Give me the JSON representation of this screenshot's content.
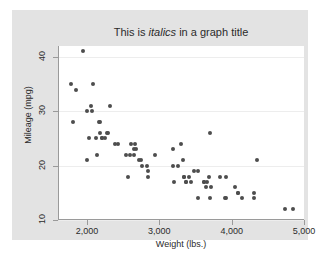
{
  "figure": {
    "background_color": "#e3e3e3",
    "plot_background_color": "#ffffff",
    "axis_color": "#9a9a9a",
    "grid_color": "#ededed",
    "marker_color": "#4d4d4d"
  },
  "title": {
    "prefix": "This is ",
    "emphasis": "italics",
    "suffix": " in a graph title"
  },
  "chart_data": {
    "type": "scatter",
    "title": "This is italics in a graph title",
    "title_emphasis_word": "italics",
    "xlabel": "Weight (lbs.)",
    "ylabel": "Mileage (mpg)",
    "xlim": [
      1600,
      5000
    ],
    "ylim": [
      10,
      42
    ],
    "xticks": [
      2000,
      3000,
      4000,
      5000
    ],
    "xticklabels": [
      "2,000",
      "3,000",
      "4,000",
      "5,000"
    ],
    "yticks": [
      10,
      20,
      30,
      40
    ],
    "yticklabels": [
      "10",
      "20",
      "30",
      "40"
    ],
    "grid": true,
    "grid_axis": "y",
    "legend": null,
    "marker": "circle",
    "marker_size": 4,
    "n_points": 74,
    "series": [
      {
        "name": "Mileage vs Weight",
        "x": [
          2930,
          3350,
          2640,
          3250,
          4080,
          3670,
          3690,
          3180,
          3700,
          3470,
          3600,
          3905,
          3330,
          4290,
          4080,
          3350,
          4030,
          3640,
          4720,
          3830,
          2580,
          3280,
          3400,
          2730,
          2370,
          2020,
          2280,
          2750,
          1800,
          1990,
          3600,
          3330,
          3185,
          3690,
          3910,
          3520,
          3425,
          3630,
          3525,
          4130,
          3320,
          4330,
          3900,
          4290,
          2110,
          2200,
          2150,
          2670,
          2595,
          2700,
          2556,
          2200,
          2120,
          2650,
          2230,
          2830,
          2810,
          1760,
          2050,
          2410,
          2520,
          2260,
          2300,
          2640,
          2830,
          2070,
          1930,
          1990,
          2160,
          2040,
          1830,
          2160,
          4840,
          3170
        ],
        "y": [
          22,
          17,
          22,
          20,
          15,
          18,
          26,
          20,
          16,
          19,
          17,
          18,
          18,
          15,
          15,
          17,
          16,
          17,
          12,
          18,
          22,
          24,
          18,
          21,
          24,
          25,
          26,
          20,
          28,
          21,
          17,
          18,
          17,
          14,
          14,
          14,
          17,
          16,
          19,
          14,
          21,
          21,
          14,
          14,
          25,
          25,
          28,
          23,
          24,
          21,
          18,
          25,
          22,
          24,
          25,
          19,
          20,
          35,
          30,
          24,
          22,
          26,
          31,
          23,
          18,
          35,
          41,
          30,
          28,
          31,
          34,
          26,
          12,
          23
        ]
      }
    ]
  },
  "axes": {
    "xaxis_title": "Weight (lbs.)",
    "yaxis_title": "Mileage (mpg)",
    "xticklabels": [
      "2,000",
      "3,000",
      "4,000",
      "5,000"
    ],
    "yticklabels": [
      "40",
      "30",
      "20",
      "10"
    ]
  }
}
